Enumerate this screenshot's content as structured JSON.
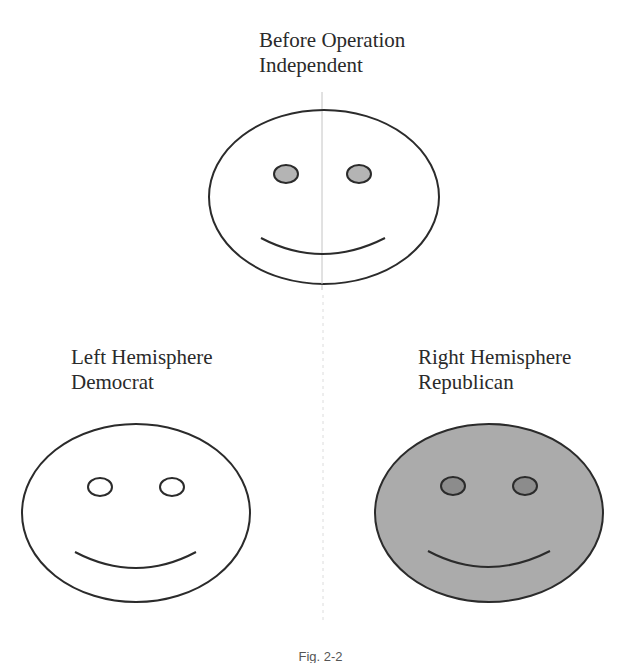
{
  "figure": {
    "caption": "Fig. 2-2",
    "colors": {
      "stroke": "#2b2b2b",
      "white_fill": "#ffffff",
      "gray_face_fill": "#ababab",
      "gray_eye_fill_top": "#b4b4b4",
      "gray_eye_fill_right": "#8c8c8c",
      "divider": "#c8c8c8"
    },
    "faces": [
      {
        "id": "before-operation",
        "title_line1": "Before Operation",
        "title_line2": "Independent",
        "fill": "white",
        "eyes": "gray"
      },
      {
        "id": "left-hemisphere",
        "title_line1": "Left Hemisphere",
        "title_line2": "Democrat",
        "fill": "white",
        "eyes": "white"
      },
      {
        "id": "right-hemisphere",
        "title_line1": "Right Hemisphere",
        "title_line2": "Republican",
        "fill": "gray",
        "eyes": "dark-gray"
      }
    ]
  }
}
